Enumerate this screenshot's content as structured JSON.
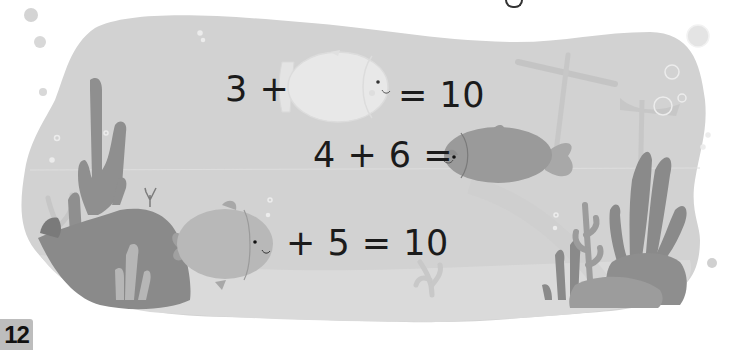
{
  "page": {
    "number": "12",
    "top_text_fragment": "g"
  },
  "colors": {
    "water": "#d2d2d2",
    "sand": "#dcdcdc",
    "seaweed": "#8e8e8e",
    "rock": "#909090",
    "fish_ghost": "#e8e8e8",
    "fish_dark": "#9a9a9a",
    "fish_light": "#b8b8b8",
    "text": "#1b1b1b",
    "page_tab": "#bdbdbd"
  },
  "equations": [
    {
      "left": "3 +",
      "blank": "ghost-fish",
      "right": "= 10"
    },
    {
      "left": "4 + 6 =",
      "blank": "dark-fish",
      "right": ""
    },
    {
      "left": "",
      "blank": "light-fish",
      "right": "+ 5 = 10"
    }
  ],
  "scene": {
    "elements": [
      "seaweed-left",
      "rock-left",
      "coral-small",
      "shipwreck-mast",
      "seaweed-right",
      "rock-right",
      "bubbles",
      "coral-faint"
    ]
  }
}
